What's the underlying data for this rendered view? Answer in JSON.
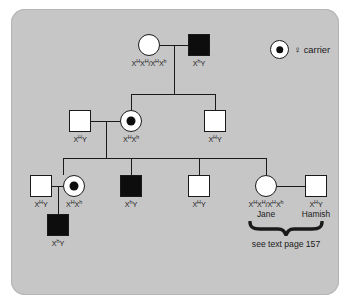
{
  "figure": {
    "type": "pedigree-chart",
    "caption": "see text page 157",
    "background_color": "#c6c6c6",
    "symbol_fill_affected": "#0d0d0d",
    "symbol_fill_unaffected": "#ffffff",
    "line_color": "#1a1a1a"
  },
  "legend": {
    "symbol": "carrier-female-symbol",
    "female_glyph": "♀",
    "label": "carrier",
    "text": "♀ carrier"
  },
  "generations": [
    {
      "id": "I",
      "individuals": [
        {
          "id": "I-1",
          "sex": "female",
          "shape": "circle",
          "status": "unaffected",
          "carrier": false,
          "genotype_html": "X<sup>H</sup>X<sup>H</sup>/X<sup>H</sup>X<sup>h</sup>",
          "genotype_text": "XHXH/XHXh",
          "name": ""
        },
        {
          "id": "I-2",
          "sex": "male",
          "shape": "square",
          "status": "affected",
          "carrier": false,
          "genotype_html": "X<sup>h</sup>Y",
          "genotype_text": "XhY",
          "name": ""
        }
      ]
    },
    {
      "id": "II",
      "individuals": [
        {
          "id": "II-1",
          "sex": "male",
          "shape": "square",
          "status": "unaffected",
          "carrier": false,
          "genotype_html": "X<sup>H</sup>Y",
          "genotype_text": "XHY",
          "name": ""
        },
        {
          "id": "II-2",
          "sex": "female",
          "shape": "circle",
          "status": "carrier",
          "carrier": true,
          "genotype_html": "X<sup>H</sup>X<sup>h</sup>",
          "genotype_text": "XHXh",
          "name": ""
        },
        {
          "id": "II-3",
          "sex": "male",
          "shape": "square",
          "status": "unaffected",
          "carrier": false,
          "genotype_html": "X<sup>H</sup>Y",
          "genotype_text": "XHY",
          "name": ""
        }
      ]
    },
    {
      "id": "III",
      "individuals": [
        {
          "id": "III-1",
          "sex": "male",
          "shape": "square",
          "status": "unaffected",
          "carrier": false,
          "genotype_html": "X<sup>H</sup>Y",
          "genotype_text": "XHY",
          "name": ""
        },
        {
          "id": "III-2",
          "sex": "female",
          "shape": "circle",
          "status": "carrier",
          "carrier": true,
          "genotype_html": "X<sup>H</sup>X<sup>h</sup>",
          "genotype_text": "XHXh",
          "name": ""
        },
        {
          "id": "III-3",
          "sex": "male",
          "shape": "square",
          "status": "affected",
          "carrier": false,
          "genotype_html": "X<sup>h</sup>Y",
          "genotype_text": "XhY",
          "name": ""
        },
        {
          "id": "III-4",
          "sex": "male",
          "shape": "square",
          "status": "unaffected",
          "carrier": false,
          "genotype_html": "X<sup>H</sup>Y",
          "genotype_text": "XHY",
          "name": ""
        },
        {
          "id": "III-5",
          "sex": "female",
          "shape": "circle",
          "status": "unaffected",
          "carrier": false,
          "genotype_html": "X<sup>H</sup>X<sup>H</sup>/X<sup>H</sup>X<sup>h</sup>",
          "genotype_text": "XHXH/XHXh",
          "name": "Jane"
        },
        {
          "id": "III-6",
          "sex": "male",
          "shape": "square",
          "status": "unaffected",
          "carrier": false,
          "genotype_html": "X<sup>H</sup>Y",
          "genotype_text": "XHY",
          "name": "Hamish"
        }
      ]
    },
    {
      "id": "IV",
      "individuals": [
        {
          "id": "IV-1",
          "sex": "male",
          "shape": "square",
          "status": "affected",
          "carrier": false,
          "genotype_html": "X<sup>h</sup>Y",
          "genotype_text": "XhY",
          "name": ""
        }
      ]
    }
  ]
}
